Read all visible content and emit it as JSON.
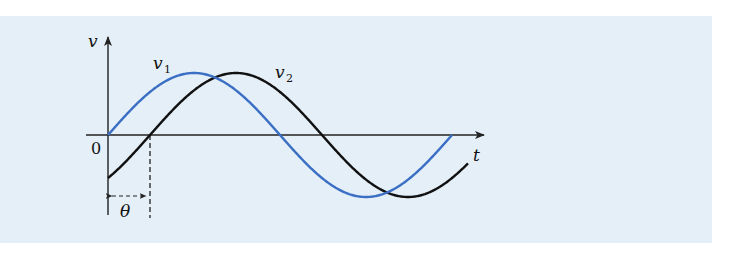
{
  "figure": {
    "background_color": "#e5eff8",
    "axes": {
      "y_label": "v",
      "x_label": "t",
      "origin_label": "0"
    },
    "curves": [
      {
        "name": "v1",
        "label_main": "v",
        "label_sub": "1",
        "color": "#3a6fc4",
        "phase_shift": "0"
      },
      {
        "name": "v2",
        "label_main": "v",
        "label_sub": "2",
        "color": "#111111",
        "phase_shift": "θ"
      }
    ],
    "phase_annotation": "θ"
  },
  "chart_data": {
    "type": "line",
    "title": "",
    "xlabel": "t",
    "ylabel": "v",
    "series": [
      {
        "name": "v1",
        "expression": "Vm·sin(ωt)",
        "color": "#3a6fc4",
        "x_start": 0,
        "x_end_periods": 1.0
      },
      {
        "name": "v2",
        "expression": "Vm·sin(ωt − θ)",
        "color": "#111111",
        "x_start": 0,
        "x_end_periods": 1.04,
        "lag": "θ ≈ 0.122 period"
      }
    ],
    "annotations": [
      "0",
      "θ"
    ],
    "grid": false
  }
}
